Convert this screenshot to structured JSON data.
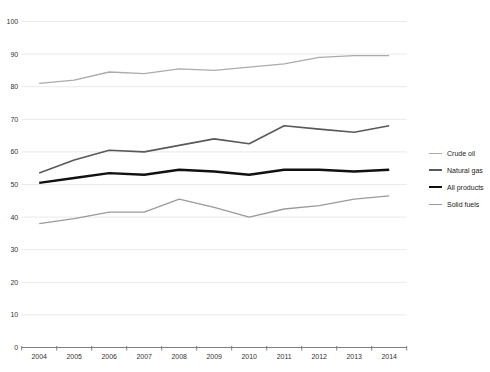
{
  "chart_data": {
    "type": "line",
    "title": "",
    "xlabel": "",
    "ylabel": "",
    "x_labels": [
      "2004",
      "2005",
      "2006",
      "2007",
      "2008",
      "2009",
      "2010",
      "2011",
      "2012",
      "2013",
      "2014"
    ],
    "ylim": [
      0,
      100
    ],
    "ytick_step": 10,
    "y_tick_labels": [
      "0",
      "10",
      "20",
      "30",
      "40",
      "50",
      "60",
      "70",
      "80",
      "90",
      "100"
    ],
    "grid": true,
    "legend_position": "right",
    "series": [
      {
        "name": "Crude oil",
        "color": "#ababab",
        "line_width": 1.3,
        "values": [
          81,
          82,
          84.5,
          84,
          85.5,
          85,
          86,
          87,
          89,
          89.5,
          89.5
        ]
      },
      {
        "name": "Natural gas",
        "color": "#595959",
        "line_width": 1.6,
        "values": [
          53.5,
          57.5,
          60.5,
          60,
          62,
          64,
          62.5,
          68,
          67,
          66,
          68
        ]
      },
      {
        "name": "All products",
        "color": "#111111",
        "line_width": 2.4,
        "values": [
          50.5,
          52,
          53.5,
          53,
          54.5,
          54,
          53,
          54.5,
          54.5,
          54,
          54.5
        ]
      },
      {
        "name": "Solid fuels",
        "color": "#9a9a9a",
        "line_width": 1.3,
        "values": [
          38,
          39.5,
          41.5,
          41.5,
          45.5,
          43,
          40,
          42.5,
          43.5,
          45.5,
          46.5
        ]
      }
    ],
    "style": {
      "gridline_color": "#e9e9e9",
      "axis_color": "#7f7f7f",
      "tick_label_color": "#333333",
      "background": "#ffffff"
    }
  }
}
